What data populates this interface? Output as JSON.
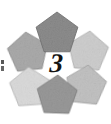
{
  "figure": {
    "background_color": "#ffffff",
    "width": 111,
    "height": 124,
    "center_number": "3",
    "center_number_color": "#131313",
    "shape_type": "pentagon",
    "shape_count": 6,
    "arrangement": "ring",
    "texture": "speckled-grain",
    "shapes": [
      {
        "id": "pentagon-top",
        "position": "top",
        "fill": "#8d8d8d",
        "stroke": "#6f6f6f",
        "cx": 57,
        "cy": 34,
        "r": 22,
        "rotation": 0
      },
      {
        "id": "pentagon-upper-left",
        "position": "upper-left",
        "fill": "#acacac",
        "stroke": "#8c8c8c",
        "cx": 28,
        "cy": 53,
        "r": 21,
        "rotation": -6
      },
      {
        "id": "pentagon-upper-right",
        "position": "upper-right",
        "fill": "#cfcfcf",
        "stroke": "#aeaeae",
        "cx": 88,
        "cy": 52,
        "r": 21,
        "rotation": 5
      },
      {
        "id": "pentagon-lower-left",
        "position": "lower-left",
        "fill": "#dcdcdc",
        "stroke": "#b8b8b8",
        "cx": 30,
        "cy": 88,
        "r": 21,
        "rotation": -4
      },
      {
        "id": "pentagon-lower-right",
        "position": "lower-right",
        "fill": "#c4c4c4",
        "stroke": "#a2a2a2",
        "cx": 86,
        "cy": 86,
        "r": 21,
        "rotation": 6
      },
      {
        "id": "pentagon-bottom",
        "position": "bottom",
        "fill": "#9a9a9a",
        "stroke": "#7c7c7c",
        "cx": 57,
        "cy": 96,
        "r": 21,
        "rotation": 2
      }
    ],
    "edge_fragment": {
      "description": "cropped glyph fragment at left margin",
      "color": "#3a3a3a"
    }
  }
}
